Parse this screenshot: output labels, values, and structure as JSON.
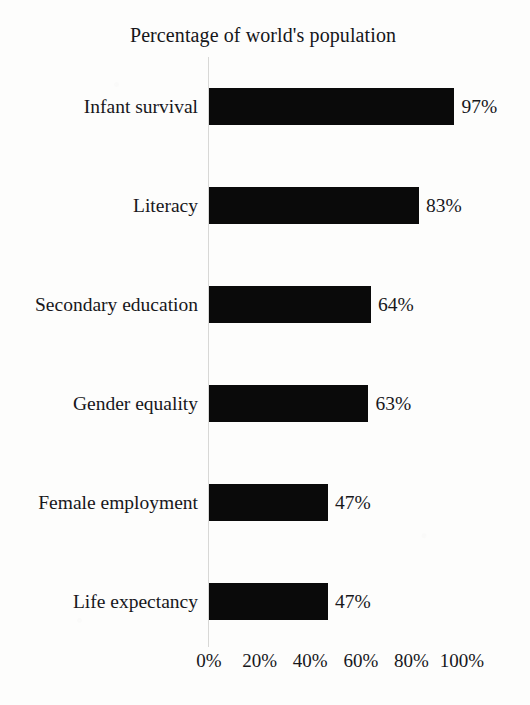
{
  "chart_data": {
    "type": "bar",
    "orientation": "horizontal",
    "title": "Percentage of world's population",
    "xlabel": "",
    "ylabel": "",
    "xlim": [
      0,
      100
    ],
    "grid": false,
    "legend": false,
    "legend_position": "none",
    "bar_color": "#0a0a0a",
    "axis_line_color": "#d8d8d6",
    "background_color": "#fdfdfc",
    "text_color": "#17171b",
    "xticks": [
      0,
      20,
      40,
      60,
      80,
      100
    ],
    "xtick_labels": [
      "0%",
      "20%",
      "40%",
      "60%",
      "80%",
      "100%"
    ],
    "categories": [
      "Infant survival",
      "Literacy",
      "Secondary education",
      "Gender equality",
      "Female employment",
      "Life expectancy"
    ],
    "values": [
      97,
      83,
      64,
      63,
      47,
      47
    ],
    "value_labels": [
      "97%",
      "83%",
      "64%",
      "63%",
      "47%",
      "47%"
    ]
  }
}
